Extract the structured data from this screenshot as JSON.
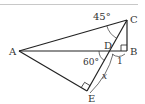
{
  "diagram": {
    "type": "geometry-figure",
    "colors": {
      "line": "#222222",
      "label": "#333333",
      "rule": "#bbbbbb",
      "background": "#ffffff"
    },
    "points": {
      "A": {
        "label": "A",
        "x": 19,
        "y": 51
      },
      "B": {
        "label": "B",
        "x": 127,
        "y": 51
      },
      "C": {
        "label": "C",
        "x": 127,
        "y": 20
      },
      "D": {
        "label": "D",
        "x": 110,
        "y": 51
      },
      "E": {
        "label": "E",
        "x": 87,
        "y": 91
      }
    },
    "segments": [
      "AC",
      "AB",
      "CB",
      "CE",
      "AE"
    ],
    "angles": {
      "ACD": {
        "label": "45°"
      },
      "ADE": {
        "label": "60°"
      }
    },
    "right_angles": [
      "B",
      "E"
    ],
    "lengths": {
      "DB": {
        "label": "1"
      },
      "DE": {
        "label": "x"
      }
    }
  }
}
